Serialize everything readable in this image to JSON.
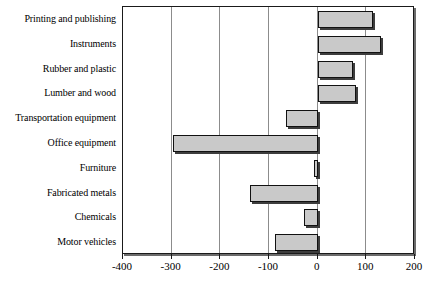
{
  "chart_data": {
    "type": "bar",
    "orientation": "horizontal",
    "title": "",
    "subtitle": "",
    "xlabel": "",
    "ylabel": "",
    "xlim": [
      -400,
      200
    ],
    "ylim": null,
    "grid": true,
    "legend": null,
    "legend_position": "none",
    "tick_labels": [
      "-400",
      "-300",
      "-200",
      "-100",
      "0",
      "100",
      "200"
    ],
    "ticks": [
      -400,
      -300,
      -200,
      -100,
      0,
      100,
      200
    ],
    "categories": [
      "Printing and publishing",
      "Instruments",
      "Rubber and plastic",
      "Lumber and wood",
      "Transportation equipment",
      "Office equipment",
      "Furniture",
      "Fabricated metals",
      "Chemicals",
      "Motor vehicles"
    ],
    "values": [
      113,
      131,
      72,
      78,
      -66,
      -298,
      -8,
      -140,
      -29,
      -88
    ],
    "bar_color": "#c9c9c9",
    "bar_border_color": "#111111",
    "plot_background": "#ffffff",
    "gridline_color": "#8c8c8c",
    "axis_color": "#1a1a1a"
  },
  "axis": {
    "x_ticks": [
      {
        "label": "-400",
        "value": -400
      },
      {
        "label": "-300",
        "value": -300
      },
      {
        "label": "-200",
        "value": -200
      },
      {
        "label": "-100",
        "value": -100
      },
      {
        "label": "0",
        "value": 0
      },
      {
        "label": "100",
        "value": 100
      },
      {
        "label": "200",
        "value": 200
      }
    ]
  }
}
